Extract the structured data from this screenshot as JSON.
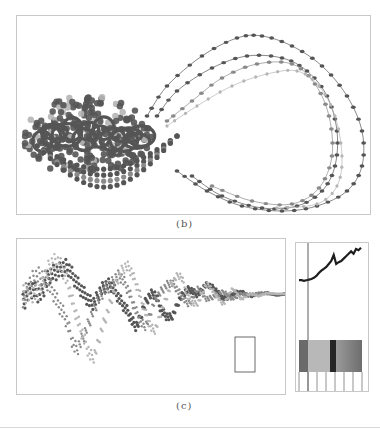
{
  "figure": {
    "captions": {
      "b": "(b)",
      "c": "(c)"
    }
  },
  "colors": {
    "dark": "#555555",
    "mid": "#8a8a8a",
    "light": "#b5b5b5",
    "border": "#c8c8c8",
    "stripe_dark": "#6a6a6a",
    "stripe_light": "#b8b8b8",
    "stripe_black": "#262626",
    "stripe_gradient_start": "#9a9a9a",
    "stripe_gradient_end": "#6e6e6e"
  },
  "chart_data": [
    {
      "id": "b",
      "type": "scatter",
      "title": "(b)",
      "description": "Phase-space trajectories forming a loop: a dense cluster of large dots on the left and several dotted orbit lines sweeping to the right",
      "xlabel": "",
      "ylabel": "",
      "grid": false,
      "series": [
        {
          "name": "orbit-outer",
          "shade": "dark",
          "points": [
            [
              130,
              100
            ],
            [
              150,
              70
            ],
            [
              185,
              40
            ],
            [
              220,
              22
            ],
            [
              245,
              20
            ],
            [
              275,
              30
            ],
            [
              305,
              50
            ],
            [
              330,
              80
            ],
            [
              345,
              115
            ],
            [
              345,
              150
            ],
            [
              330,
              175
            ],
            [
              300,
              190
            ],
            [
              265,
              195
            ],
            [
              225,
              190
            ],
            [
              190,
              175
            ],
            [
              160,
              155
            ]
          ]
        },
        {
          "name": "orbit-2",
          "shade": "dark",
          "points": [
            [
              140,
              100
            ],
            [
              160,
              75
            ],
            [
              195,
              52
            ],
            [
              230,
              40
            ],
            [
              265,
              42
            ],
            [
              290,
              55
            ],
            [
              310,
              80
            ],
            [
              320,
              115
            ],
            [
              318,
              150
            ],
            [
              305,
              175
            ],
            [
              280,
              190
            ],
            [
              245,
              192
            ],
            [
              205,
              180
            ],
            [
              175,
              160
            ]
          ]
        },
        {
          "name": "orbit-3",
          "shade": "mid",
          "points": [
            [
              150,
              105
            ],
            [
              175,
              85
            ],
            [
              205,
              62
            ],
            [
              240,
              48
            ],
            [
              275,
              48
            ],
            [
              298,
              68
            ],
            [
              312,
              100
            ],
            [
              315,
              140
            ],
            [
              302,
              172
            ],
            [
              275,
              188
            ],
            [
              235,
              185
            ],
            [
              195,
              170
            ]
          ]
        },
        {
          "name": "orbit-4",
          "shade": "light",
          "points": [
            [
              150,
              110
            ],
            [
              180,
              90
            ],
            [
              215,
              70
            ],
            [
              250,
              58
            ],
            [
              280,
              55
            ],
            [
              302,
              70
            ],
            [
              318,
              100
            ],
            [
              325,
              140
            ],
            [
              320,
              170
            ],
            [
              300,
              188
            ],
            [
              260,
              192
            ]
          ]
        }
      ],
      "cluster": {
        "cx": 70,
        "cy": 120,
        "rx": 65,
        "ry": 40
      }
    },
    {
      "id": "c-main",
      "type": "line",
      "title": "(c)",
      "description": "Multiple overlapping dotted time series with large oscillations on the left, damping toward the right; a small rectangle highlights a region near the right",
      "series": [
        {
          "name": "series-dark",
          "shade": "dark",
          "values": [
            60,
            45,
            50,
            30,
            25,
            20,
            35,
            50,
            60,
            45,
            40,
            55,
            70,
            85,
            60,
            50,
            70,
            75,
            55,
            45,
            50,
            40,
            45,
            55,
            50,
            48,
            52,
            50,
            49,
            51,
            50
          ]
        },
        {
          "name": "series-mid",
          "shade": "mid",
          "values": [
            55,
            35,
            30,
            40,
            60,
            80,
            110,
            95,
            70,
            50,
            40,
            30,
            45,
            70,
            85,
            60,
            45,
            38,
            50,
            60,
            45,
            55,
            52,
            48,
            55,
            50,
            51,
            49,
            50,
            50,
            50
          ]
        },
        {
          "name": "series-light",
          "shade": "light",
          "values": [
            50,
            50,
            45,
            20,
            15,
            35,
            70,
            100,
            120,
            90,
            60,
            30,
            20,
            40,
            70,
            90,
            65,
            40,
            30,
            55,
            60,
            40,
            50,
            60,
            45,
            55,
            50,
            52,
            49,
            50,
            50
          ]
        }
      ],
      "highlight_box": {
        "x": 218,
        "y": 98,
        "w": 20,
        "h": 35
      }
    },
    {
      "id": "c-side",
      "type": "line",
      "description": "Zoomed detail: rising noisy dark line with vertical marker, color stripe bar and vertical tick lines below",
      "series": [
        {
          "name": "detail-line",
          "shade": "black",
          "values": [
            62,
            62,
            63,
            62,
            61,
            60,
            58,
            55,
            50,
            46,
            43,
            40,
            35,
            30,
            20,
            35,
            32,
            30,
            26,
            22,
            18,
            14,
            18,
            10,
            12,
            8
          ]
        }
      ],
      "marker_x": 12,
      "stripes": [
        {
          "color": "stripe_dark",
          "width": 9
        },
        {
          "color": "stripe_light",
          "width": 22
        },
        {
          "color": "stripe_black",
          "width": 6
        },
        {
          "color": "gradient",
          "width": 26
        }
      ],
      "ticks": 8
    }
  ]
}
